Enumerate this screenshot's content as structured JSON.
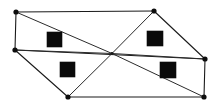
{
  "figure": {
    "type": "diagram",
    "canvas": {
      "width": 219,
      "height": 110,
      "background": "#ffffff"
    },
    "colors": {
      "stroke": "#1a1a1a",
      "spoke": "#2b2b2b",
      "vertex_fill": "#0d0d0d",
      "square_fill": "#0a0a0a",
      "background": "#ffffff"
    },
    "center": {
      "name": "center-hub",
      "x": 112,
      "y": 53.5,
      "r": 1.4
    },
    "vertices": [
      {
        "name": "vertex-top-left",
        "label": "A",
        "x": 16,
        "y": 12,
        "r": 2.6
      },
      {
        "name": "vertex-top-right",
        "label": "B",
        "x": 154,
        "y": 11,
        "r": 2.6
      },
      {
        "name": "vertex-right",
        "label": "C",
        "x": 205,
        "y": 59,
        "r": 2.6
      },
      {
        "name": "vertex-bottom-right",
        "label": "D",
        "x": 204,
        "y": 97,
        "r": 2.6
      },
      {
        "name": "vertex-bottom-left",
        "label": "E",
        "x": 68,
        "y": 97,
        "r": 2.6
      },
      {
        "name": "vertex-left",
        "label": "F",
        "x": 15,
        "y": 50,
        "r": 2.6
      }
    ],
    "outline_edges": [
      {
        "name": "edge-top-left-to-top-right",
        "x1": 16,
        "y1": 12,
        "x2": 154,
        "y2": 11
      },
      {
        "name": "edge-top-right-to-right",
        "x1": 154,
        "y1": 11,
        "x2": 205,
        "y2": 59
      },
      {
        "name": "edge-right-to-bottom-right",
        "x1": 205,
        "y1": 59,
        "x2": 204,
        "y2": 97
      },
      {
        "name": "edge-bottom-right-to-bottom-left",
        "x1": 204,
        "y1": 97,
        "x2": 68,
        "y2": 97
      },
      {
        "name": "edge-bottom-left-to-left",
        "x1": 68,
        "y1": 97,
        "x2": 15,
        "y2": 50
      },
      {
        "name": "edge-left-to-top-left",
        "x1": 15,
        "y1": 50,
        "x2": 16,
        "y2": 12
      },
      {
        "name": "edge-left-to-right-horizontal",
        "x1": 15,
        "y1": 50,
        "x2": 205,
        "y2": 59
      }
    ],
    "spokes": [
      {
        "name": "spoke-center-to-top-left",
        "x1": 112,
        "y1": 53.5,
        "x2": 16,
        "y2": 12
      },
      {
        "name": "spoke-center-to-top-right",
        "x1": 112,
        "y1": 53.5,
        "x2": 154,
        "y2": 11
      },
      {
        "name": "spoke-center-to-right",
        "x1": 112,
        "y1": 53.5,
        "x2": 205,
        "y2": 59
      },
      {
        "name": "spoke-center-to-bottom-right",
        "x1": 112,
        "y1": 53.5,
        "x2": 204,
        "y2": 97
      },
      {
        "name": "spoke-center-to-bottom-left",
        "x1": 112,
        "y1": 53.5,
        "x2": 68,
        "y2": 97
      },
      {
        "name": "spoke-center-to-left",
        "x1": 112,
        "y1": 53.5,
        "x2": 15,
        "y2": 50
      }
    ],
    "squares": [
      {
        "name": "square-upper-left",
        "label": "1",
        "x": 47,
        "y": 32,
        "width": 15,
        "height": 15
      },
      {
        "name": "square-upper-right",
        "label": "2",
        "x": 147,
        "y": 31,
        "width": 16,
        "height": 15
      },
      {
        "name": "square-lower-left",
        "label": "3",
        "x": 60,
        "y": 62,
        "width": 15,
        "height": 15
      },
      {
        "name": "square-lower-right",
        "label": "4",
        "x": 160,
        "y": 62,
        "width": 16,
        "height": 16
      }
    ]
  }
}
